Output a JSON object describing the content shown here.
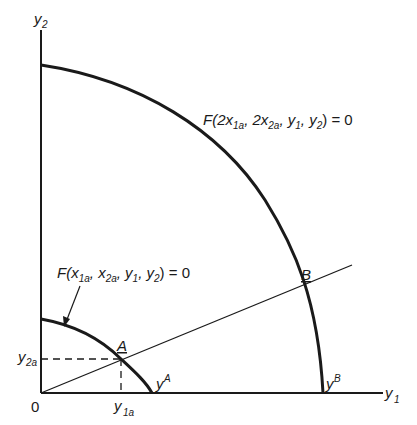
{
  "figure": {
    "axes": {
      "x_label": "y",
      "x_label_sub": "1",
      "y_label": "y",
      "y_label_sub": "2",
      "origin_label": "0"
    },
    "curves": [
      {
        "id": "outer",
        "label_prefix": "F(2x",
        "label_parts": [
          "F(2x",
          "1a",
          ", 2x",
          "2a",
          ", y",
          "1",
          ", y",
          "2",
          ") = 0"
        ],
        "intercept_label": "y",
        "intercept_sup": "B"
      },
      {
        "id": "inner",
        "label_parts": [
          "F(x",
          "1a",
          ", x",
          "2a",
          ", y",
          "1",
          ", y",
          "2",
          ") = 0"
        ],
        "intercept_label": "y",
        "intercept_sup": "A"
      }
    ],
    "points": [
      {
        "id": "A",
        "label": "A",
        "x_tick": "y",
        "x_tick_sub": "1a",
        "y_tick": "y",
        "y_tick_sub": "2a"
      },
      {
        "id": "B",
        "label": "B"
      }
    ],
    "colors": {
      "ink": "#1a1a1a",
      "background": "#ffffff"
    }
  }
}
